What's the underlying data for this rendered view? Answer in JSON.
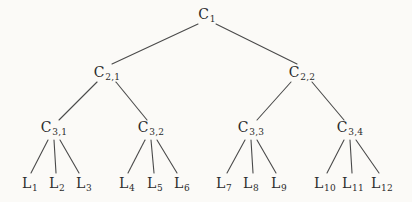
{
  "diagram": {
    "type": "tree",
    "background_color": "#fbfaf7",
    "line_color": "#4a4a4a",
    "text_color": "#2b2b2b",
    "nodes": [
      {
        "id": "C1",
        "base": "C",
        "sub": "1",
        "x": 207,
        "y": 15
      },
      {
        "id": "C2-1",
        "base": "C",
        "sub": "2,1",
        "x": 107,
        "y": 73
      },
      {
        "id": "C2-2",
        "base": "C",
        "sub": "2,2",
        "x": 302,
        "y": 73
      },
      {
        "id": "C3-1",
        "base": "C",
        "sub": "3,1",
        "x": 54,
        "y": 128
      },
      {
        "id": "C3-2",
        "base": "C",
        "sub": "3,2",
        "x": 151,
        "y": 128
      },
      {
        "id": "C3-3",
        "base": "C",
        "sub": "3,3",
        "x": 251,
        "y": 128
      },
      {
        "id": "C3-4",
        "base": "C",
        "sub": "3,4",
        "x": 350,
        "y": 128
      },
      {
        "id": "L1",
        "base": "L",
        "sub": "1",
        "x": 30,
        "y": 184
      },
      {
        "id": "L2",
        "base": "L",
        "sub": "2",
        "x": 57,
        "y": 184
      },
      {
        "id": "L3",
        "base": "L",
        "sub": "3",
        "x": 84,
        "y": 184
      },
      {
        "id": "L4",
        "base": "L",
        "sub": "4",
        "x": 127,
        "y": 184
      },
      {
        "id": "L5",
        "base": "L",
        "sub": "5",
        "x": 155,
        "y": 184
      },
      {
        "id": "L6",
        "base": "L",
        "sub": "6",
        "x": 182,
        "y": 184
      },
      {
        "id": "L7",
        "base": "L",
        "sub": "7",
        "x": 224,
        "y": 184
      },
      {
        "id": "L8",
        "base": "L",
        "sub": "8",
        "x": 251,
        "y": 184
      },
      {
        "id": "L9",
        "base": "L",
        "sub": "9",
        "x": 279,
        "y": 184
      },
      {
        "id": "L10",
        "base": "L",
        "sub": "10",
        "x": 325,
        "y": 184
      },
      {
        "id": "L11",
        "base": "L",
        "sub": "11",
        "x": 353,
        "y": 184
      },
      {
        "id": "L12",
        "base": "L",
        "sub": "12",
        "x": 382,
        "y": 184
      }
    ],
    "edges": [
      {
        "from": "C1",
        "to": "C2-1",
        "x1": 198,
        "y1": 24,
        "x2": 112,
        "y2": 64
      },
      {
        "from": "C1",
        "to": "C2-2",
        "x1": 216,
        "y1": 24,
        "x2": 297,
        "y2": 64
      },
      {
        "from": "C2-1",
        "to": "C3-1",
        "x1": 97,
        "y1": 82,
        "x2": 59,
        "y2": 120
      },
      {
        "from": "C2-1",
        "to": "C3-2",
        "x1": 116,
        "y1": 82,
        "x2": 147,
        "y2": 120
      },
      {
        "from": "C2-2",
        "to": "C3-3",
        "x1": 291,
        "y1": 82,
        "x2": 257,
        "y2": 120
      },
      {
        "from": "C2-2",
        "to": "C3-4",
        "x1": 312,
        "y1": 82,
        "x2": 344,
        "y2": 120
      },
      {
        "from": "C3-1",
        "to": "L1",
        "x1": 48,
        "y1": 140,
        "x2": 31,
        "y2": 173
      },
      {
        "from": "C3-1",
        "to": "L2",
        "x1": 54,
        "y1": 140,
        "x2": 56,
        "y2": 173
      },
      {
        "from": "C3-1",
        "to": "L3",
        "x1": 60,
        "y1": 140,
        "x2": 79,
        "y2": 173
      },
      {
        "from": "C3-2",
        "to": "L4",
        "x1": 145,
        "y1": 140,
        "x2": 128,
        "y2": 173
      },
      {
        "from": "C3-2",
        "to": "L5",
        "x1": 151,
        "y1": 140,
        "x2": 154,
        "y2": 173
      },
      {
        "from": "C3-2",
        "to": "L6",
        "x1": 157,
        "y1": 140,
        "x2": 177,
        "y2": 173
      },
      {
        "from": "C3-3",
        "to": "L7",
        "x1": 245,
        "y1": 140,
        "x2": 227,
        "y2": 173
      },
      {
        "from": "C3-3",
        "to": "L8",
        "x1": 251,
        "y1": 140,
        "x2": 253,
        "y2": 173
      },
      {
        "from": "C3-3",
        "to": "L9",
        "x1": 257,
        "y1": 140,
        "x2": 276,
        "y2": 173
      },
      {
        "from": "C3-4",
        "to": "L10",
        "x1": 344,
        "y1": 140,
        "x2": 327,
        "y2": 173
      },
      {
        "from": "C3-4",
        "to": "L11",
        "x1": 350,
        "y1": 140,
        "x2": 352,
        "y2": 173
      },
      {
        "from": "C3-4",
        "to": "L12",
        "x1": 356,
        "y1": 140,
        "x2": 379,
        "y2": 173
      }
    ]
  }
}
